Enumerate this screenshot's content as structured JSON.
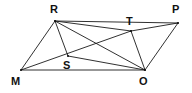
{
  "figure": {
    "type": "geometry-diagram",
    "background_color": "#ffffff",
    "line_color": "#1a1a1a",
    "label_color": "#111111",
    "canvas": {
      "width": 192,
      "height": 93
    },
    "vertices": [
      {
        "id": "R",
        "label": "R",
        "x": 55,
        "y": 21,
        "label_x": 50,
        "label_y": 4
      },
      {
        "id": "P",
        "label": "P",
        "x": 178,
        "y": 23,
        "label_x": 172,
        "label_y": 4
      },
      {
        "id": "T",
        "label": "T",
        "x": 131,
        "y": 31,
        "label_x": 126,
        "label_y": 16
      },
      {
        "id": "S",
        "label": "S",
        "x": 68,
        "y": 56,
        "label_x": 63,
        "label_y": 60
      },
      {
        "id": "M",
        "label": "M",
        "x": 21,
        "y": 70,
        "label_x": 11,
        "label_y": 76
      },
      {
        "id": "O",
        "label": "O",
        "x": 145,
        "y": 70,
        "label_x": 139,
        "label_y": 76
      }
    ],
    "edges": [
      {
        "from": "R",
        "to": "P",
        "name": "segment-RP"
      },
      {
        "from": "R",
        "to": "M",
        "name": "segment-RM"
      },
      {
        "from": "M",
        "to": "O",
        "name": "segment-MO"
      },
      {
        "from": "P",
        "to": "O",
        "name": "segment-PO"
      },
      {
        "from": "R",
        "to": "S",
        "name": "segment-RS"
      },
      {
        "from": "R",
        "to": "T",
        "name": "segment-RT"
      },
      {
        "from": "R",
        "to": "O",
        "name": "segment-RO"
      },
      {
        "from": "M",
        "to": "T",
        "name": "segment-MT"
      },
      {
        "from": "T",
        "to": "P",
        "name": "segment-TP"
      },
      {
        "from": "T",
        "to": "O",
        "name": "segment-TO"
      },
      {
        "from": "S",
        "to": "O",
        "name": "segment-SO"
      }
    ]
  }
}
